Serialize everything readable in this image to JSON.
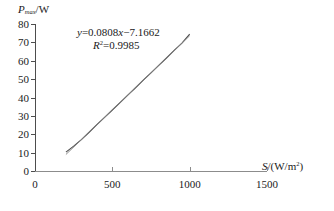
{
  "chart_data": {
    "type": "scatter",
    "title": "",
    "xlabel": "S/(W/m2)",
    "ylabel": "Pmax/W",
    "xlim": [
      0,
      1500
    ],
    "ylim": [
      0,
      80
    ],
    "xticks": [
      0,
      500,
      1000,
      1500
    ],
    "yticks": [
      0,
      10,
      20,
      30,
      40,
      50,
      60,
      70,
      80
    ],
    "xtick_labels": [
      "0",
      "500",
      "1000",
      "1500"
    ],
    "ytick_labels": [
      "0",
      "10",
      "20",
      "30",
      "40",
      "50",
      "60",
      "70",
      "80"
    ],
    "grid": false,
    "legend": "none",
    "series": [
      {
        "name": "measured",
        "x": [
          200,
          250,
          300,
          350,
          400,
          450,
          500,
          550,
          600,
          650,
          700,
          750,
          800,
          850,
          900,
          950,
          1000
        ],
        "y": [
          10.3,
          13.5,
          17.1,
          21.1,
          25.2,
          29.2,
          33.2,
          37.2,
          41.3,
          45.3,
          49.4,
          53.4,
          57.5,
          61.5,
          65.6,
          69.6,
          74.5
        ]
      },
      {
        "name": "linear-fit",
        "x": [
          200,
          1000
        ],
        "y": [
          9.0,
          73.6
        ]
      }
    ],
    "annotations": {
      "equation_y": "y",
      "equation_body": "=0.0808",
      "equation_x": "x",
      "equation_tail": "−7.1662",
      "r2_symbol": "R",
      "r2_exponent": "2",
      "r2_value": "=0.9985"
    },
    "axis_label_parts": {
      "y_symbol": "P",
      "y_subscript": "max",
      "y_unit": "/W",
      "x_symbol": "S",
      "x_unit_open": "/(W/m",
      "x_unit_exp": "2",
      "x_unit_close": ")"
    },
    "colors": {
      "series": "#4d4d4d",
      "fit": "#808080",
      "axis": "#4d4d4d",
      "axis_x": "#8c8c8c",
      "text": "#1a1a1a",
      "background": "#ffffff"
    }
  }
}
